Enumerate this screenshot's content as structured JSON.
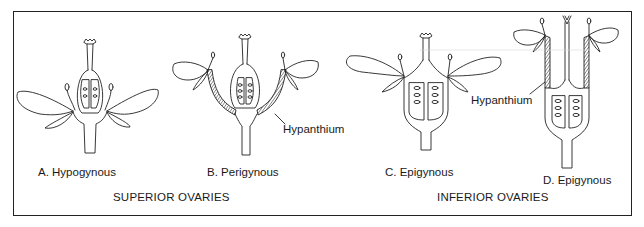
{
  "figure": {
    "panels": [
      {
        "id": "A",
        "label": "A. Hypogynous"
      },
      {
        "id": "B",
        "label": "B. Perigynous"
      },
      {
        "id": "C",
        "label": "C. Epigynous"
      },
      {
        "id": "D",
        "label": "D. Epigynous"
      }
    ],
    "annotations": {
      "hypanthium_B": "Hypanthium",
      "hypanthium_D": "Hypanthium"
    },
    "groups": {
      "superior": "SUPERIOR OVARIES",
      "inferior": "INFERIOR OVARIES"
    },
    "colors": {
      "line": "#222222",
      "background": "#ffffff"
    }
  }
}
